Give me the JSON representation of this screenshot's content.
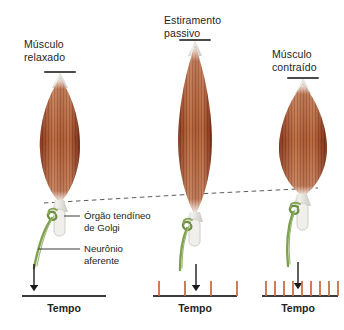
{
  "figure": {
    "kind": "biology-diagram",
    "background_color": "#ffffff"
  },
  "palette": {
    "muscle_dark": "#8a3a1e",
    "muscle_mid": "#a9542c",
    "muscle_light": "#c87a4c",
    "muscle_stripe": "#6f2d16",
    "tendon": "#e9e7e2",
    "nerve_green": "#7fa050",
    "nerve_green_dark": "#5d7a38",
    "capsule": "#dcdcd4",
    "spike_orange": "#c8643c",
    "axis_black": "#3b3b3b",
    "text": "#231f20",
    "dashed_line": "#5a5a5a"
  },
  "panels": [
    {
      "id": "relaxed",
      "title": "Músculo\nrelaxado",
      "state": "relaxed",
      "muscle": {
        "width": 40,
        "height": 122,
        "top": 78
      },
      "tempo_label": "Tempo",
      "spike_count": 0,
      "spikes": []
    },
    {
      "id": "passive-stretch",
      "title": "Estiramento\npassivo",
      "state": "passively stretched",
      "muscle": {
        "width": 34,
        "height": 168,
        "top": 46
      },
      "tempo_label": "Tempo",
      "spike_count": 4,
      "spikes": [
        6,
        32,
        58,
        84
      ]
    },
    {
      "id": "contracted",
      "title": "Músculo\ncontraído",
      "state": "contracted",
      "muscle": {
        "width": 48,
        "height": 112,
        "top": 84
      },
      "tempo_label": "Tempo",
      "spike_count": 9,
      "spikes": [
        4,
        13,
        22,
        31,
        40,
        49,
        58,
        67,
        76
      ]
    }
  ],
  "callouts": [
    {
      "id": "golgi",
      "text": "Órgão tendíneo\nde Golgi"
    },
    {
      "id": "neuron",
      "text": "Neurônio\naferente"
    }
  ],
  "annotations": {
    "dashed_alignment_line": "dashed reference line across tendon level of all three muscles",
    "down_arrows": "vertical arrows from afferent neuron to the time axis in each panel"
  }
}
